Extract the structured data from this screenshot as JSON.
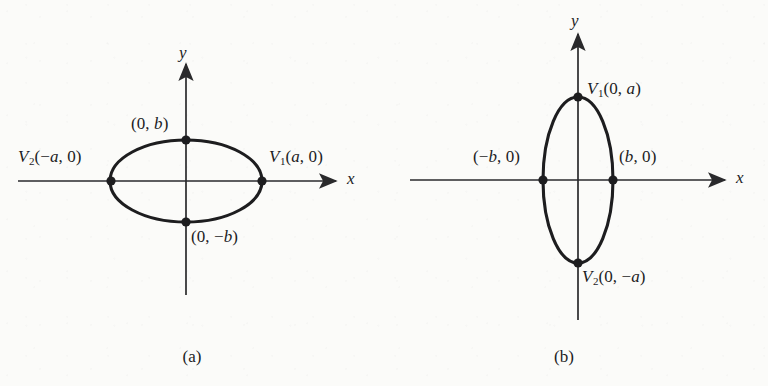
{
  "figure": {
    "background_color": "#fbfbf9",
    "ink_color": "#1d1d1f",
    "panels": [
      {
        "caption": "(a)",
        "orientation": "horizontal-major-axis",
        "axis_x_label": "x",
        "axis_y_label": "y",
        "ellipse": {
          "center": [
            186,
            181
          ],
          "semi_axis_x": 76,
          "semi_axis_y": 41
        },
        "points": [
          {
            "name": "vertex-right",
            "label_html": "<i>V</i><sub>1</sub>(<i>a</i>, 0)",
            "label_text": "V1(a, 0)",
            "coords": [
              262,
              181
            ]
          },
          {
            "name": "vertex-left",
            "label_html": "<i>V</i><sub>2</sub>(&#8722;<i>a</i>, 0)",
            "label_text": "V2(-a, 0)",
            "coords": [
              111,
              181
            ]
          },
          {
            "name": "covertex-top",
            "label_html": "(0, <i>b</i>)",
            "label_text": "(0, b)",
            "coords": [
              186,
              140
            ]
          },
          {
            "name": "covertex-bottom",
            "label_html": "(0, &#8722;<i>b</i>)",
            "label_text": "(0, -b)",
            "coords": [
              186,
              222
            ]
          }
        ]
      },
      {
        "caption": "(b)",
        "orientation": "vertical-major-axis",
        "axis_x_label": "x",
        "axis_y_label": "y",
        "ellipse": {
          "center": [
            194,
            180
          ],
          "semi_axis_x": 35,
          "semi_axis_y": 83
        },
        "points": [
          {
            "name": "vertex-top",
            "label_html": "<i>V</i><sub>1</sub>(0, <i>a</i>)",
            "label_text": "V1(0, a)",
            "coords": [
              194,
              97
            ]
          },
          {
            "name": "vertex-bottom",
            "label_html": "<i>V</i><sub>2</sub>(0, &#8722;<i>a</i>)",
            "label_text": "V2(0, -a)",
            "coords": [
              194,
              263
            ]
          },
          {
            "name": "covertex-left",
            "label_html": "(&#8722;<i>b</i>, 0)",
            "label_text": "(-b, 0)",
            "coords": [
              159,
              180
            ]
          },
          {
            "name": "covertex-right",
            "label_html": "(<i>b</i>, 0)",
            "label_text": "(b, 0)",
            "coords": [
              229,
              180
            ]
          }
        ]
      }
    ]
  }
}
